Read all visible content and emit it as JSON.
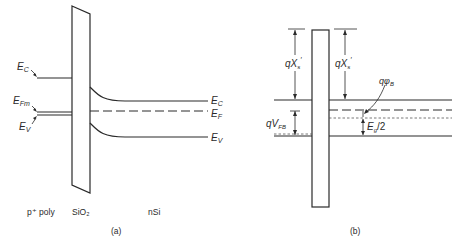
{
  "figure": {
    "panel_a": {
      "caption": "(a)",
      "region_labels": {
        "gate": "p⁺ poly",
        "oxide": "SiO₂",
        "substrate": "nSi"
      },
      "left_labels": {
        "ec": "E",
        "ec_sub": "C",
        "efm": "E",
        "efm_sub": "Fm",
        "ev": "E",
        "ev_sub": "V"
      },
      "right_labels": {
        "ec": "E",
        "ec_sub": "C",
        "ef": "E",
        "ef_sub": "F",
        "ev": "E",
        "ev_sub": "V"
      }
    },
    "panel_b": {
      "caption": "(b)",
      "labels": {
        "chi_left": "qX",
        "chi_left_sub": "s",
        "chi_left_prime": "′",
        "chi_right": "qX",
        "chi_right_sub": "s",
        "chi_right_prime": "′",
        "phi_b": "qφ",
        "phi_b_sub": "B",
        "vfb": "qV",
        "vfb_sub": "FB",
        "eg_half": "E",
        "eg_half_sub": "g",
        "eg_half_suffix": "/2"
      }
    },
    "colors": {
      "line": "#2a2a2a",
      "background": "#ffffff"
    }
  }
}
